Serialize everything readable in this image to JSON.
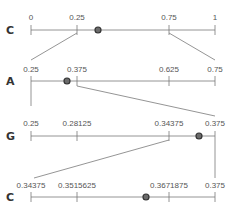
{
  "diagram": {
    "type": "arithmetic-coding-intervals",
    "rows": [
      {
        "symbol": "C",
        "ticks": [
          "0",
          "0.25",
          "0.75",
          "1"
        ],
        "range": [
          0,
          1
        ],
        "marker_value": 0.36
      },
      {
        "symbol": "A",
        "ticks": [
          "0.25",
          "0.375",
          "0.625",
          "0.75"
        ],
        "range": [
          0.25,
          0.75
        ],
        "marker_value": 0.33
      },
      {
        "symbol": "G",
        "ticks": [
          "0.25",
          "0.28125",
          "0.34375",
          "0.375"
        ],
        "range": [
          0.25,
          0.375
        ],
        "marker_value": 0.37
      },
      {
        "symbol": "C",
        "ticks": [
          "0.34375",
          "0.3515625",
          "0.3671875",
          "0.375"
        ],
        "range": [
          0.34375,
          0.375
        ],
        "marker_value": 0.362
      }
    ],
    "colors": {
      "line": "#7a7a7a",
      "marker_fill": "#6b6b6b",
      "marker_stroke": "#333333",
      "text": "#555555"
    }
  }
}
